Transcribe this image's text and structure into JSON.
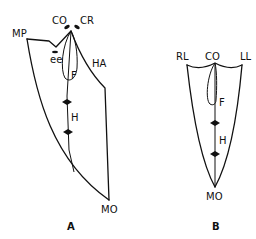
{
  "figures": [
    {
      "id": "A",
      "caption": "A",
      "labels": {
        "co": "CO",
        "cr": "CR",
        "mp": "MP",
        "ee": "ee",
        "ha": "HA",
        "f": "F",
        "h": "H",
        "mo": "MO"
      }
    },
    {
      "id": "B",
      "caption": "B",
      "labels": {
        "rl": "RL",
        "co": "CO",
        "ll": "LL",
        "f": "F",
        "h": "H",
        "mo": "MO"
      }
    }
  ],
  "colors": {
    "line": "#111111",
    "background": "#ffffff"
  }
}
